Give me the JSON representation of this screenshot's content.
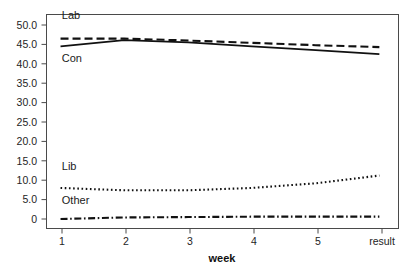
{
  "chart_data": {
    "type": "line",
    "title": "",
    "subtitle": "",
    "xlabel": "week",
    "ylabel": "",
    "x": [
      1,
      2,
      3,
      4,
      5,
      6
    ],
    "categories": [
      "1",
      "2",
      "3",
      "4",
      "5",
      "result"
    ],
    "xtick_labels": [
      "1",
      "2",
      "3",
      "4",
      "5",
      "result"
    ],
    "ytick_labels": [
      "0",
      "5.0",
      "10.0",
      "15.0",
      "20.0",
      "25.0",
      "30.0",
      "35.0",
      "40.0",
      "45.0",
      "50.0"
    ],
    "ytick_values": [
      0,
      5,
      10,
      15,
      20,
      25,
      30,
      35,
      40,
      45,
      50
    ],
    "ylim": [
      0,
      53
    ],
    "xlim": [
      0.78,
      6.3
    ],
    "grid": false,
    "legend_position": "inline-labels",
    "series": [
      {
        "name": "Lab",
        "label": "Lab",
        "line_style": "dashed",
        "color": "#111111",
        "values": [
          46.5,
          46.5,
          46.0,
          45.4,
          44.8,
          44.3
        ]
      },
      {
        "name": "Con",
        "label": "Con",
        "line_style": "solid",
        "color": "#111111",
        "values": [
          44.5,
          46.1,
          45.5,
          44.5,
          43.5,
          42.5
        ]
      },
      {
        "name": "Lib",
        "label": "Lib",
        "line_style": "dotted",
        "color": "#111111",
        "values": [
          8.0,
          7.4,
          7.4,
          8.0,
          9.2,
          11.2
        ]
      },
      {
        "name": "Other",
        "label": "Other",
        "line_style": "dashdot",
        "color": "#111111",
        "values": [
          0.0,
          0.4,
          0.5,
          0.6,
          0.6,
          0.6
        ]
      }
    ],
    "inline_labels": [
      {
        "text": "Lab",
        "x": 1.02,
        "y": 51.5
      },
      {
        "text": "Con",
        "x": 1.02,
        "y": 40.6
      },
      {
        "text": "Lib",
        "x": 1.02,
        "y": 12.6
      },
      {
        "text": "Other",
        "x": 1.02,
        "y": 4.0
      }
    ]
  },
  "caption": {
    "ghost_text": ""
  }
}
